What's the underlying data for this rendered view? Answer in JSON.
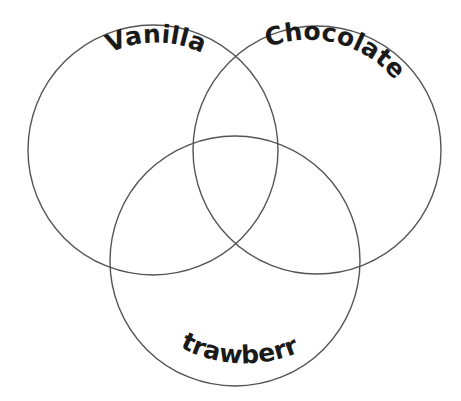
{
  "diagram": {
    "type": "venn",
    "stroke_color": "#555555",
    "text_color": "#1a1a1a",
    "background": "#ffffff",
    "sets": [
      {
        "label": "Vanilla",
        "cx": 153,
        "cy": 150,
        "r": 125
      },
      {
        "label": "Chocolate",
        "cx": 317,
        "cy": 150,
        "r": 124
      },
      {
        "label": "Strawberry",
        "cx": 235,
        "cy": 261,
        "r": 125
      }
    ]
  }
}
